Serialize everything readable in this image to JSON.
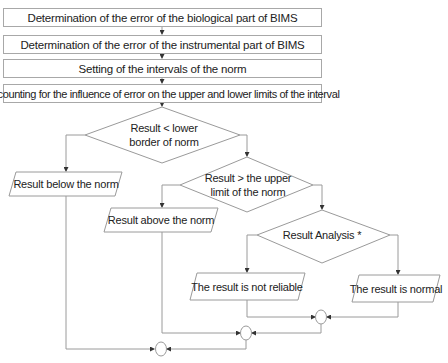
{
  "flowchart": {
    "steps": [
      {
        "label": "Determination of the error of the biological part of BIMS"
      },
      {
        "label": "Determination of the error of the instrumental part of BIMS"
      },
      {
        "label": "Setting of the intervals of the norm"
      },
      {
        "label": "Accounting for the influence of error on the upper and lower limits of the interval"
      }
    ],
    "decisions": [
      {
        "line1": "Result < lower",
        "line2": "border of norm"
      },
      {
        "line1": "Result > the upper",
        "line2": "limit of the norm"
      },
      {
        "line1": "Result Analysis *",
        "line2": ""
      }
    ],
    "outputs": [
      {
        "label": "Result below the norm"
      },
      {
        "label": "Result above the norm"
      },
      {
        "label": "The result is not reliable"
      },
      {
        "label": "The result is normal"
      }
    ],
    "colors": {
      "line": "#9a9a9a",
      "arrow": "#333333",
      "text": "#222222"
    }
  }
}
